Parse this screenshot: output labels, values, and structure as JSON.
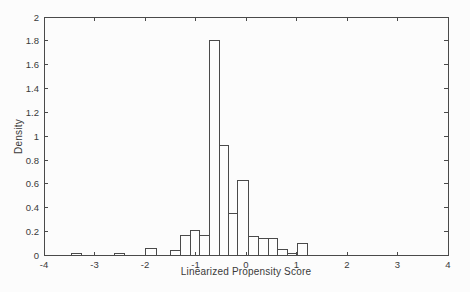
{
  "figure": {
    "background": "#fcfcfc",
    "line_color": "#4a4a4a",
    "text_color": "#3a3a3a",
    "bar_fill": "#fdfdfd"
  },
  "chart_data": {
    "type": "bar",
    "subtype": "histogram",
    "title": "",
    "xlabel": "Linearized Propensity Score",
    "ylabel": "Density",
    "xlim": [
      -4,
      4
    ],
    "ylim": [
      0,
      2
    ],
    "grid": false,
    "legend_position": "none",
    "xtick_values": [
      -4,
      -3,
      -2,
      -1,
      0,
      1,
      2,
      3,
      4
    ],
    "xtick_labels": [
      "-4",
      "-3",
      "-2",
      "-1",
      "0",
      "1",
      "2",
      "3",
      "4"
    ],
    "ytick_values": [
      0,
      0.2,
      0.4,
      0.6,
      0.8,
      1,
      1.2,
      1.4,
      1.6,
      1.8,
      2
    ],
    "ytick_labels": [
      "0",
      "0.2",
      "0.4",
      "0.6",
      "0.8",
      "1",
      "1.2",
      "1.4",
      "1.6",
      "1.8",
      "2"
    ],
    "bins": [
      {
        "left": -3.45,
        "right": -3.25,
        "height": 0.02
      },
      {
        "left": -2.6,
        "right": -2.4,
        "height": 0.02
      },
      {
        "left": -2.0,
        "right": -1.78,
        "height": 0.06
      },
      {
        "left": -1.5,
        "right": -1.3,
        "height": 0.045
      },
      {
        "left": -1.3,
        "right": -1.1,
        "height": 0.17
      },
      {
        "left": -1.1,
        "right": -0.92,
        "height": 0.21
      },
      {
        "left": -0.92,
        "right": -0.73,
        "height": 0.17
      },
      {
        "left": -0.73,
        "right": -0.53,
        "height": 1.8
      },
      {
        "left": -0.53,
        "right": -0.34,
        "height": 0.92
      },
      {
        "left": -0.34,
        "right": -0.16,
        "height": 0.35
      },
      {
        "left": -0.16,
        "right": 0.04,
        "height": 0.63
      },
      {
        "left": 0.04,
        "right": 0.24,
        "height": 0.16
      },
      {
        "left": 0.24,
        "right": 0.44,
        "height": 0.14
      },
      {
        "left": 0.44,
        "right": 0.62,
        "height": 0.14
      },
      {
        "left": 0.62,
        "right": 0.82,
        "height": 0.05
      },
      {
        "left": 0.82,
        "right": 1.02,
        "height": 0.02
      },
      {
        "left": 1.02,
        "right": 1.21,
        "height": 0.1
      }
    ]
  }
}
